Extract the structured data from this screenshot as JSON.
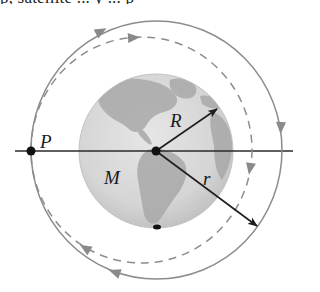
{
  "header_fragment": {
    "text": "p, satellite ... y ... p"
  },
  "diagram": {
    "labels": {
      "point": "P",
      "earth_radius": "R",
      "earth_mass": "M",
      "orbit_radius": "r"
    },
    "colors": {
      "background": "#ffffff",
      "axis_line": "#2a2a2a",
      "orbit_solid": "#8c8c8c",
      "orbit_dashed": "#8c8c8c",
      "arrow_fill": "#8a8a8a",
      "vector": "#1e1e1e",
      "earth_ocean": "#d9d9d9",
      "earth_land": "#a9a9a9",
      "point_marker": "#111111"
    },
    "geometry": {
      "earth_center": [
        156,
        151
      ],
      "earth_radius_px": 77,
      "point_p": [
        31,
        151
      ],
      "solid_orbit": {
        "cx": 156.5,
        "cy": 150,
        "rx": 125.5,
        "ry": 129
      },
      "dashed_orbit": {
        "cx": 141.5,
        "cy": 150,
        "rx": 110.5,
        "ry": 113
      },
      "vector_R_tip": [
        217,
        109
      ],
      "vector_r_tip": [
        257,
        226
      ],
      "axis_line": {
        "x1": 15,
        "x2": 293,
        "y": 151
      }
    },
    "orbits": [
      {
        "name": "outer orbit",
        "style": "solid",
        "direction": "clockwise"
      },
      {
        "name": "inner orbit",
        "style": "dashed",
        "direction": "clockwise"
      }
    ]
  }
}
